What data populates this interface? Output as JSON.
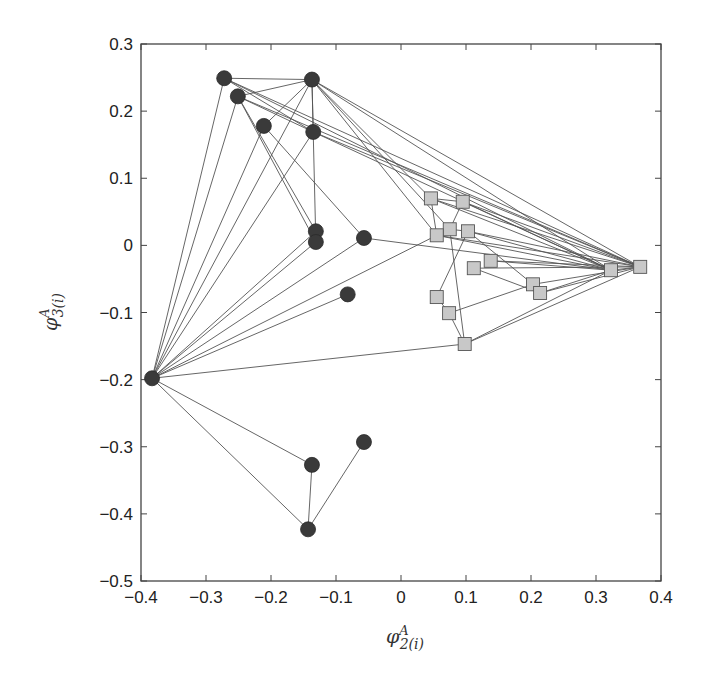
{
  "chart_data": {
    "type": "scatter",
    "title": "",
    "xlabel": "φ2A(i)",
    "ylabel": "φ3A(i)",
    "xlabel_parts": {
      "base": "φ",
      "sup": "A",
      "sub": "2",
      "suffix": "(i)"
    },
    "ylabel_parts": {
      "base": "φ",
      "sup": "A",
      "sub": "3",
      "suffix": "(i)"
    },
    "xlim": [
      -0.4,
      0.4
    ],
    "ylim": [
      -0.5,
      0.3
    ],
    "xticks": [
      -0.4,
      -0.3,
      -0.2,
      -0.1,
      0,
      0.1,
      0.2,
      0.3,
      0.4
    ],
    "xtick_labels": [
      "−0.4",
      "−0.3",
      "−0.2",
      "−0.1",
      "0",
      "0.1",
      "0.2",
      "0.3",
      "0.4"
    ],
    "yticks": [
      0.3,
      0.2,
      0.1,
      0,
      -0.1,
      -0.2,
      -0.3,
      -0.4,
      -0.5
    ],
    "ytick_labels": [
      "0.3",
      "0.2",
      "0.1",
      "0",
      "−0.1",
      "−0.2",
      "−0.3",
      "−0.4",
      "−0.5"
    ],
    "grid": false,
    "legend": null,
    "series": [
      {
        "name": "group-circles",
        "marker": "circle",
        "color": "#3a3a3a",
        "points": [
          {
            "id": "A",
            "x": -0.272,
            "y": 0.249
          },
          {
            "id": "B",
            "x": -0.137,
            "y": 0.247
          },
          {
            "id": "C",
            "x": -0.251,
            "y": 0.222
          },
          {
            "id": "D",
            "x": -0.211,
            "y": 0.178
          },
          {
            "id": "E",
            "x": -0.135,
            "y": 0.169
          },
          {
            "id": "F",
            "x": -0.131,
            "y": 0.021
          },
          {
            "id": "G",
            "x": -0.131,
            "y": 0.005
          },
          {
            "id": "H",
            "x": -0.057,
            "y": 0.011
          },
          {
            "id": "I",
            "x": -0.383,
            "y": -0.198
          },
          {
            "id": "J",
            "x": -0.082,
            "y": -0.073
          },
          {
            "id": "K",
            "x": -0.137,
            "y": -0.327
          },
          {
            "id": "L",
            "x": -0.057,
            "y": -0.293
          },
          {
            "id": "M",
            "x": -0.143,
            "y": -0.423
          }
        ]
      },
      {
        "name": "group-squares",
        "marker": "square",
        "color": "#c8c8c8",
        "points": [
          {
            "id": "S1",
            "x": 0.046,
            "y": 0.07
          },
          {
            "id": "S2",
            "x": 0.095,
            "y": 0.065
          },
          {
            "id": "S3",
            "x": 0.075,
            "y": 0.024
          },
          {
            "id": "S4",
            "x": 0.055,
            "y": 0.015
          },
          {
            "id": "S5",
            "x": 0.103,
            "y": 0.021
          },
          {
            "id": "S6",
            "x": 0.138,
            "y": -0.023
          },
          {
            "id": "S7",
            "x": 0.112,
            "y": -0.034
          },
          {
            "id": "S8",
            "x": 0.203,
            "y": -0.058
          },
          {
            "id": "S9",
            "x": 0.214,
            "y": -0.071
          },
          {
            "id": "S10",
            "x": 0.055,
            "y": -0.077
          },
          {
            "id": "S11",
            "x": 0.074,
            "y": -0.101
          },
          {
            "id": "S12",
            "x": 0.098,
            "y": -0.147
          },
          {
            "id": "S13",
            "x": 0.323,
            "y": -0.037
          },
          {
            "id": "S14",
            "x": 0.368,
            "y": -0.032
          }
        ]
      }
    ],
    "edges": [
      [
        "I",
        "A"
      ],
      [
        "I",
        "C"
      ],
      [
        "I",
        "D"
      ],
      [
        "I",
        "B"
      ],
      [
        "I",
        "E"
      ],
      [
        "I",
        "F"
      ],
      [
        "I",
        "G"
      ],
      [
        "I",
        "H"
      ],
      [
        "I",
        "J"
      ],
      [
        "I",
        "S4"
      ],
      [
        "I",
        "S12"
      ],
      [
        "I",
        "K"
      ],
      [
        "I",
        "M"
      ],
      [
        "K",
        "M"
      ],
      [
        "M",
        "L"
      ],
      [
        "A",
        "B"
      ],
      [
        "A",
        "E"
      ],
      [
        "A",
        "S14"
      ],
      [
        "A",
        "S13"
      ],
      [
        "C",
        "B"
      ],
      [
        "C",
        "E"
      ],
      [
        "C",
        "F"
      ],
      [
        "C",
        "G"
      ],
      [
        "C",
        "S14"
      ],
      [
        "D",
        "B"
      ],
      [
        "D",
        "H"
      ],
      [
        "B",
        "E"
      ],
      [
        "B",
        "G"
      ],
      [
        "B",
        "S1"
      ],
      [
        "B",
        "S4"
      ],
      [
        "B",
        "S3"
      ],
      [
        "B",
        "S14"
      ],
      [
        "B",
        "S13"
      ],
      [
        "E",
        "S14"
      ],
      [
        "E",
        "S13"
      ],
      [
        "H",
        "S13"
      ],
      [
        "S1",
        "S2"
      ],
      [
        "S1",
        "S4"
      ],
      [
        "S1",
        "S14"
      ],
      [
        "S1",
        "S13"
      ],
      [
        "S2",
        "S3"
      ],
      [
        "S2",
        "S14"
      ],
      [
        "S2",
        "S13"
      ],
      [
        "S3",
        "S5"
      ],
      [
        "S3",
        "S12"
      ],
      [
        "S4",
        "S14"
      ],
      [
        "S4",
        "S13"
      ],
      [
        "S5",
        "S8"
      ],
      [
        "S5",
        "S10"
      ],
      [
        "S5",
        "S14"
      ],
      [
        "S5",
        "S13"
      ],
      [
        "S6",
        "S14"
      ],
      [
        "S6",
        "S13"
      ],
      [
        "S7",
        "S9"
      ],
      [
        "S7",
        "S14"
      ],
      [
        "S8",
        "S14"
      ],
      [
        "S9",
        "S14"
      ],
      [
        "S9",
        "S13"
      ],
      [
        "S10",
        "S11"
      ],
      [
        "S11",
        "S12"
      ],
      [
        "S11",
        "S8"
      ],
      [
        "S12",
        "S14"
      ],
      [
        "S12",
        "S13"
      ],
      [
        "S13",
        "S14"
      ]
    ]
  },
  "layout": {
    "plot": {
      "left": 141,
      "top": 44,
      "right": 661,
      "bottom": 581
    },
    "edge_color": "#555555",
    "axis_color": "#444444"
  }
}
